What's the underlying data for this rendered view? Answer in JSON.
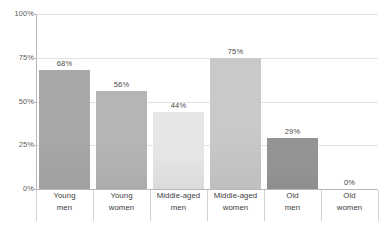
{
  "chart_data": {
    "type": "bar",
    "title": "",
    "subtitle": "",
    "xlabel": "",
    "ylabel": "",
    "categories": [
      "Young men",
      "Young women",
      "Middle-aged men",
      "Middle-aged women",
      "Old men",
      "Old women"
    ],
    "category_lines": [
      [
        "Young",
        "men"
      ],
      [
        "Young",
        "women"
      ],
      [
        "Middle-aged",
        "men"
      ],
      [
        "Middle-aged",
        "women"
      ],
      [
        "Old",
        "men"
      ],
      [
        "Old",
        "women"
      ]
    ],
    "values": [
      68,
      56,
      44,
      75,
      29,
      0
    ],
    "value_labels": [
      "68%",
      "56%",
      "44%",
      "75%",
      "29%",
      "0%"
    ],
    "bar_colors": [
      "#a8a8a8",
      "#b5b5b5",
      "#e6e6e6",
      "#c9c9c9",
      "#949494",
      "#ffffff"
    ],
    "ylim": [
      0,
      100
    ],
    "yticks": [
      100,
      75,
      50,
      25,
      0
    ],
    "ytick_labels": [
      "100%",
      "75%",
      "50%",
      "25%",
      "0%"
    ],
    "grid": true,
    "legend": "none",
    "axis_color": "#b9b9b9",
    "gridline_color": "#e2e2e2",
    "background": "#ffffff"
  }
}
